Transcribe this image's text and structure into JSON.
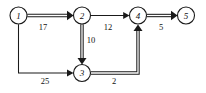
{
  "diagram": {
    "type": "directed-weighted-graph",
    "title": "",
    "nodes": [
      {
        "id": "1",
        "label": "1",
        "cx": 18.5,
        "cy": 15.5,
        "r": 8.5
      },
      {
        "id": "2",
        "label": "2",
        "cx": 82.0,
        "cy": 15.5,
        "r": 8.5
      },
      {
        "id": "3",
        "label": "3",
        "cx": 82.0,
        "cy": 73.0,
        "r": 8.5
      },
      {
        "id": "4",
        "label": "4",
        "cx": 138.0,
        "cy": 15.5,
        "r": 8.5
      },
      {
        "id": "5",
        "label": "5",
        "cx": 186.0,
        "cy": 15.5,
        "r": 8.5
      }
    ],
    "edges": [
      {
        "id": "e-1-2",
        "from": "1",
        "to": "2",
        "weight": "17",
        "style": "bold",
        "weight_x": 43,
        "weight_y": 27
      },
      {
        "id": "e-2-3",
        "from": "2",
        "to": "3",
        "weight": "10",
        "style": "bold",
        "weight_x": 91,
        "weight_y": 40
      },
      {
        "id": "e-2-4",
        "from": "2",
        "to": "4",
        "weight": "12",
        "style": "thin",
        "weight_x": 108,
        "weight_y": 27
      },
      {
        "id": "e-4-5",
        "from": "4",
        "to": "5",
        "weight": "5",
        "style": "bold",
        "weight_x": 161,
        "weight_y": 27
      },
      {
        "id": "e-1-3",
        "from": "1",
        "to": "3",
        "weight": "25",
        "style": "thin",
        "weight_x": 45,
        "weight_y": 81
      },
      {
        "id": "e-3-4",
        "from": "3",
        "to": "4",
        "weight": "2",
        "style": "bold",
        "weight_x": 114,
        "weight_y": 81
      }
    ],
    "colors": {
      "stroke": "#1a1a1a",
      "node_fill": "#ffffff",
      "background": "#ffffff",
      "text": "#111111"
    }
  }
}
